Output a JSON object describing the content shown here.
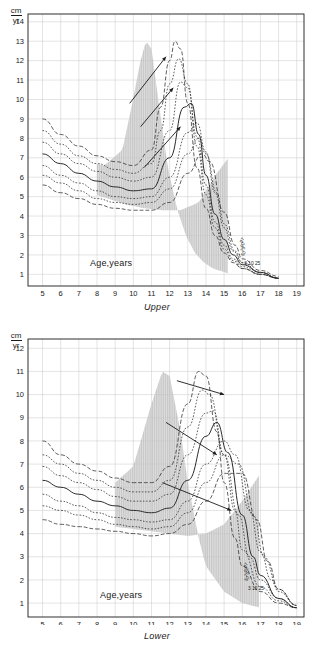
{
  "figure": {
    "unit_top": "cm",
    "unit_bottom": "yr",
    "age_label": "Age,years",
    "percentile_label_cluster": "3 10 25 50 75 90 97",
    "percentile_labels_small": [
      "97",
      "90",
      "75",
      "50"
    ],
    "percentile_labels_baseline": "3 10 25",
    "colors": {
      "ink": "#1a1a1a",
      "band_fill": "#b4b4b4",
      "grid": "#c8c8c8",
      "curve": "#2a2a2a"
    }
  },
  "charts": [
    {
      "id": "upper",
      "caption": "Upper",
      "x_ticks": [
        5,
        6,
        7,
        8,
        9,
        10,
        11,
        12,
        13,
        14,
        15,
        16,
        17,
        18,
        19
      ],
      "y_ticks": [
        1,
        2,
        3,
        4,
        5,
        6,
        7,
        8,
        9,
        10,
        11,
        12,
        13,
        14
      ],
      "xlim": [
        4.2,
        19.4
      ],
      "ylim": [
        0.4,
        14.4
      ],
      "xlabel": "Age,years",
      "ylabel": "cm/yr",
      "band": {
        "x_start": 8.0,
        "x_end": 15.3,
        "note": "shaded pubertal spurt envelope"
      }
    },
    {
      "id": "lower",
      "caption": "Lower",
      "x_ticks": [
        5,
        6,
        7,
        8,
        9,
        10,
        11,
        12,
        13,
        14,
        15,
        16,
        17,
        18,
        19
      ],
      "y_ticks": [
        1,
        2,
        3,
        4,
        5,
        6,
        7,
        8,
        9,
        10,
        11,
        12
      ],
      "xlim": [
        4.2,
        19.4
      ],
      "ylim": [
        0.4,
        12.4
      ],
      "xlabel": "Age,years",
      "ylabel": "cm/yr",
      "band": {
        "x_start": 9.0,
        "x_end": 17.0,
        "note": "shaded pubertal spurt envelope"
      }
    }
  ],
  "chart_data": {
    "type": "line",
    "title": "",
    "xlabel": "Age, years",
    "ylabel": "cm/yr",
    "grid": true,
    "legend": "percentile labels at right of curves (97, 90, 75, 50, 25, 10, 3)",
    "panels": [
      {
        "name": "Upper",
        "caption": "Upper",
        "xlim": [
          4.2,
          19.4
        ],
        "ylim": [
          0.4,
          14.4
        ],
        "xticks": [
          5,
          6,
          7,
          8,
          9,
          10,
          11,
          12,
          13,
          14,
          15,
          16,
          17,
          18,
          19
        ],
        "yticks": [
          1,
          2,
          3,
          4,
          5,
          6,
          7,
          8,
          9,
          10,
          11,
          12,
          13,
          14
        ],
        "annotations": [
          "cm",
          "yr",
          "Age,years",
          "Upper",
          "97",
          "90",
          "75",
          "50",
          "3 10 25"
        ],
        "shaded_band": {
          "x_from": 8.0,
          "x_to": 15.3
        },
        "series": [
          {
            "name": "97th percentile",
            "x": [
              5,
              6,
              7,
              8,
              9,
              10,
              11,
              11.5,
              12,
              12.3,
              12.6,
              13,
              13.5,
              14,
              14.5,
              15,
              15.5,
              16,
              17,
              18
            ],
            "values": [
              9.0,
              8.2,
              7.6,
              7.1,
              6.8,
              6.6,
              7.4,
              9.6,
              12.0,
              13.0,
              12.6,
              9.8,
              6.5,
              4.4,
              3.0,
              2.1,
              1.6,
              1.3,
              1.0,
              0.8
            ]
          },
          {
            "name": "90th percentile",
            "x": [
              5,
              6,
              7,
              8,
              9,
              10,
              11,
              11.5,
              12,
              12.5,
              13,
              13.5,
              14,
              14.5,
              15,
              15.5,
              16,
              17,
              18
            ],
            "values": [
              8.4,
              7.7,
              7.1,
              6.7,
              6.4,
              6.2,
              6.7,
              8.4,
              10.8,
              12.1,
              10.8,
              7.6,
              5.1,
              3.4,
              2.3,
              1.7,
              1.3,
              1.0,
              0.8
            ]
          },
          {
            "name": "75th percentile",
            "x": [
              5,
              6,
              7,
              8,
              9,
              10,
              11,
              12,
              12.6,
              13,
              13.5,
              14,
              14.5,
              15,
              15.5,
              16,
              17,
              18
            ],
            "values": [
              7.8,
              7.2,
              6.7,
              6.3,
              6.0,
              5.8,
              6.0,
              8.4,
              10.9,
              10.6,
              8.1,
              5.6,
              3.7,
              2.5,
              1.8,
              1.4,
              1.0,
              0.8
            ]
          },
          {
            "name": "50th percentile",
            "x": [
              5,
              6,
              7,
              8,
              9,
              10,
              11,
              12,
              12.8,
              13.2,
              13.6,
              14,
              14.5,
              15,
              15.5,
              16,
              17,
              18
            ],
            "values": [
              7.2,
              6.7,
              6.2,
              5.8,
              5.5,
              5.3,
              5.4,
              7.0,
              9.6,
              9.8,
              8.2,
              6.1,
              4.1,
              2.8,
              2.0,
              1.5,
              1.1,
              0.8
            ]
          },
          {
            "name": "25th percentile",
            "x": [
              5,
              6,
              7,
              8,
              9,
              10,
              11,
              12,
              13,
              13.5,
              14,
              14.5,
              15,
              15.5,
              16,
              17,
              18
            ],
            "values": [
              6.6,
              6.1,
              5.7,
              5.3,
              5.0,
              4.9,
              5.0,
              6.0,
              8.3,
              8.8,
              7.3,
              5.2,
              3.4,
              2.2,
              1.6,
              1.1,
              0.8
            ]
          },
          {
            "name": "10th percentile",
            "x": [
              5,
              6,
              7,
              8,
              9,
              10,
              11,
              12,
              13,
              13.6,
              14,
              14.6,
              15,
              15.6,
              16,
              17,
              18
            ],
            "values": [
              6.1,
              5.7,
              5.3,
              4.9,
              4.7,
              4.6,
              4.7,
              5.4,
              7.2,
              8.0,
              7.2,
              5.2,
              3.6,
              2.2,
              1.6,
              1.1,
              0.8
            ]
          },
          {
            "name": "3rd percentile",
            "x": [
              5,
              6,
              7,
              8,
              9,
              10,
              11,
              12,
              13,
              13.8,
              14.2,
              15,
              15.6,
              16,
              17,
              18
            ],
            "values": [
              5.6,
              5.2,
              4.9,
              4.6,
              4.4,
              4.3,
              4.3,
              4.7,
              6.2,
              7.2,
              6.8,
              4.2,
              2.5,
              1.8,
              1.2,
              0.9
            ]
          }
        ],
        "arrows": [
          {
            "from": [
              9.8,
              9.8
            ],
            "to": [
              11.8,
              12.2
            ],
            "note": "early-maturer shift arrow"
          },
          {
            "from": [
              10.4,
              8.6
            ],
            "to": [
              12.2,
              10.6
            ],
            "note": "mid shift arrow"
          },
          {
            "from": [
              10.6,
              6.5
            ],
            "to": [
              12.6,
              8.6
            ],
            "note": "late shift arrow"
          }
        ]
      },
      {
        "name": "Lower",
        "caption": "Lower",
        "xlim": [
          4.2,
          19.4
        ],
        "ylim": [
          0.4,
          12.4
        ],
        "xticks": [
          5,
          6,
          7,
          8,
          9,
          10,
          11,
          12,
          13,
          14,
          15,
          16,
          17,
          18,
          19
        ],
        "yticks": [
          1,
          2,
          3,
          4,
          5,
          6,
          7,
          8,
          9,
          10,
          11,
          12
        ],
        "annotations": [
          "cm",
          "yr",
          "Age,years",
          "Lower",
          "97",
          "90",
          "75",
          "50",
          "3 10 25"
        ],
        "shaded_band": {
          "x_from": 9.0,
          "x_to": 17.0
        },
        "series": [
          {
            "name": "97th percentile",
            "x": [
              5,
              6,
              7,
              8,
              9,
              10,
              11,
              12,
              13,
              13.6,
              14,
              14.6,
              15,
              15.6,
              16,
              17,
              18,
              19
            ],
            "values": [
              8.0,
              7.4,
              7.0,
              6.7,
              6.4,
              6.2,
              6.2,
              6.9,
              9.6,
              11.0,
              10.8,
              8.4,
              6.2,
              3.8,
              2.6,
              1.5,
              1.0,
              0.8
            ]
          },
          {
            "name": "90th percentile",
            "x": [
              5,
              6,
              7,
              8,
              9,
              10,
              11,
              12,
              13,
              13.8,
              14.2,
              15,
              15.6,
              16,
              17,
              18,
              19
            ],
            "values": [
              7.4,
              7.0,
              6.6,
              6.3,
              6.0,
              5.8,
              5.8,
              6.3,
              8.6,
              10.2,
              10.0,
              7.4,
              5.0,
              3.3,
              1.7,
              1.1,
              0.8
            ]
          },
          {
            "name": "75th percentile",
            "x": [
              5,
              6,
              7,
              8,
              9,
              10,
              11,
              12,
              13,
              14,
              14.4,
              15,
              15.8,
              16.4,
              17,
              18,
              19
            ],
            "values": [
              6.9,
              6.5,
              6.2,
              5.9,
              5.6,
              5.4,
              5.4,
              5.7,
              7.4,
              9.2,
              9.3,
              7.4,
              4.8,
              3.0,
              2.0,
              1.2,
              0.8
            ]
          },
          {
            "name": "50th percentile",
            "x": [
              5,
              6,
              7,
              8,
              9,
              10,
              11,
              12,
              13,
              14,
              14.6,
              15.2,
              16,
              16.6,
              17,
              18,
              19
            ],
            "values": [
              6.3,
              6.0,
              5.7,
              5.4,
              5.2,
              5.0,
              4.9,
              5.1,
              6.3,
              8.2,
              8.8,
              7.5,
              4.8,
              3.0,
              2.2,
              1.2,
              0.8
            ]
          },
          {
            "name": "25th percentile",
            "x": [
              5,
              6,
              7,
              8,
              9,
              10,
              11,
              12,
              13,
              14,
              15,
              15.6,
              16.4,
              17,
              17.6,
              18,
              19
            ],
            "values": [
              5.7,
              5.4,
              5.2,
              4.9,
              4.7,
              4.6,
              4.5,
              4.6,
              5.4,
              7.0,
              8.0,
              7.4,
              5.0,
              3.2,
              2.0,
              1.5,
              0.9
            ]
          },
          {
            "name": "10th percentile",
            "x": [
              5,
              6,
              7,
              8,
              9,
              10,
              11,
              12,
              13,
              14,
              15,
              15.8,
              16.6,
              17.2,
              18,
              19
            ],
            "values": [
              5.2,
              5.0,
              4.8,
              4.6,
              4.4,
              4.3,
              4.2,
              4.3,
              4.9,
              6.2,
              7.4,
              7.0,
              4.8,
              3.0,
              1.6,
              0.9
            ]
          },
          {
            "name": "3rd percentile",
            "x": [
              5,
              6,
              7,
              8,
              9,
              10,
              11,
              12,
              13,
              14,
              15,
              16,
              16.8,
              17.4,
              18,
              19
            ],
            "values": [
              4.6,
              4.4,
              4.3,
              4.2,
              4.1,
              4.0,
              3.9,
              4.0,
              4.4,
              5.4,
              6.6,
              6.6,
              4.6,
              2.8,
              1.6,
              0.9
            ]
          }
        ],
        "arrows": [
          {
            "from": [
              12.4,
              10.6
            ],
            "to": [
              15.0,
              10.0
            ],
            "note": "early-maturer shift arrow"
          },
          {
            "from": [
              11.8,
              8.8
            ],
            "to": [
              14.6,
              7.4
            ],
            "note": "mid shift arrow"
          },
          {
            "from": [
              11.6,
              6.2
            ],
            "to": [
              15.4,
              5.0
            ],
            "note": "late shift arrow"
          }
        ]
      }
    ]
  }
}
